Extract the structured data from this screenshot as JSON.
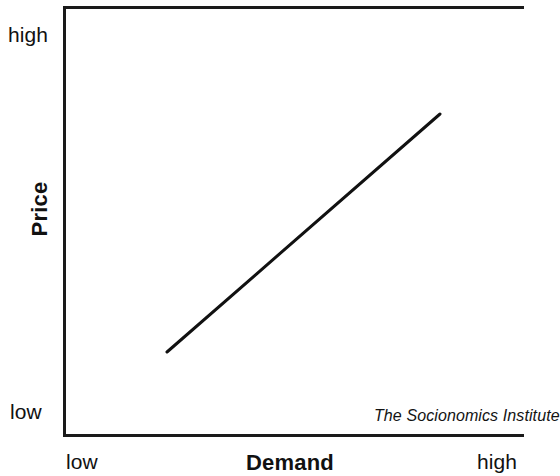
{
  "figure": {
    "background_color": "#ffffff",
    "frame_color": "#1a1a1a",
    "attribution": "The Socionomics Institute"
  },
  "axes": {
    "y": {
      "title": "Price",
      "tick_high": "high",
      "tick_low": "low"
    },
    "x": {
      "title": "Demand",
      "tick_low": "low",
      "tick_high": "high"
    }
  },
  "chart_data": {
    "type": "line",
    "title": "",
    "subtitle": "",
    "xlabel": "Demand",
    "ylabel": "Price",
    "xlim": [
      0,
      1
    ],
    "ylim": [
      0,
      1
    ],
    "xticklabels": [
      "low",
      "high"
    ],
    "yticklabels": [
      "low",
      "high"
    ],
    "grid": false,
    "legend": false,
    "legend_position": "none",
    "annotations": [
      "The Socionomics Institute"
    ],
    "series": [
      {
        "name": "Price vs. Demand",
        "color": "#111111",
        "line_width": 3,
        "x": [
          0.226,
          0.818
        ],
        "y": [
          0.191,
          0.747
        ],
        "points_px": [
          [
            167,
            352
          ],
          [
            440,
            114
          ]
        ],
        "description": "Straight upward-sloping line: price rises as demand rises"
      }
    ]
  }
}
